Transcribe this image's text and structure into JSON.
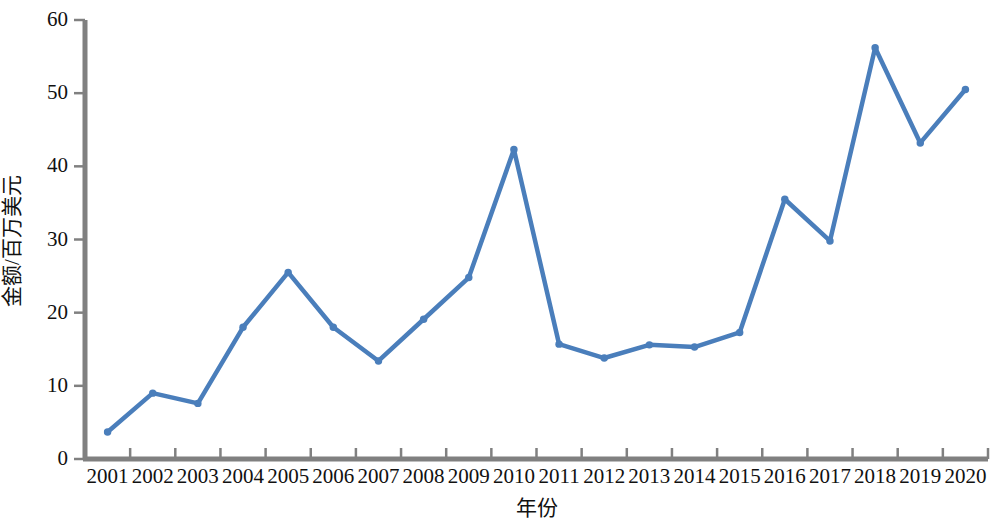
{
  "chart_data": {
    "type": "line",
    "title": "",
    "xlabel": "年份",
    "ylabel": "金额/百万美元",
    "categories": [
      "2001",
      "2002",
      "2003",
      "2004",
      "2005",
      "2006",
      "2007",
      "2008",
      "2009",
      "2010",
      "2011",
      "2012",
      "2013",
      "2014",
      "2015",
      "2016",
      "2017",
      "2018",
      "2019",
      "2020"
    ],
    "values": [
      3.7,
      9.0,
      7.6,
      18.0,
      25.5,
      18.0,
      13.4,
      19.1,
      24.8,
      42.3,
      15.7,
      13.8,
      15.6,
      15.3,
      17.3,
      35.5,
      29.8,
      56.2,
      43.2,
      50.5
    ],
    "series": [
      {
        "name": "金额",
        "values": [
          3.7,
          9.0,
          7.6,
          18.0,
          25.5,
          18.0,
          13.4,
          19.1,
          24.8,
          42.3,
          15.7,
          13.8,
          15.6,
          15.3,
          17.3,
          35.5,
          29.8,
          56.2,
          43.2,
          50.5
        ]
      }
    ],
    "y_ticks": [
      0,
      10,
      20,
      30,
      40,
      50,
      60
    ],
    "y_tick_labels": [
      "0",
      "10",
      "20",
      "30",
      "40",
      "50",
      "60"
    ],
    "ylim": [
      0,
      60
    ],
    "grid": false,
    "legend": "none",
    "line_color": "#4a7ebb",
    "marker_color": "#4a7ebb",
    "axis_color": "#808080",
    "background": "#ffffff",
    "line_width": 4,
    "marker_size": 6
  },
  "axis": {
    "y_title": "金额/百万美元",
    "x_title": "年份"
  }
}
